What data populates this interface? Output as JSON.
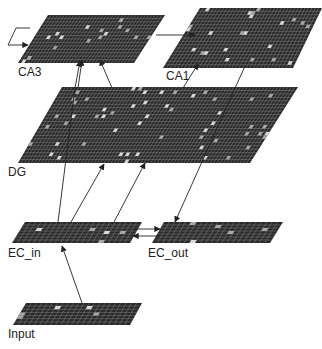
{
  "diagram": {
    "colors": {
      "background": "#ffffff",
      "layer_fill": "#2a2a2a",
      "grid_line": "#8a8a8a",
      "active_unit": "#d8d8d8",
      "arrow": "#222222",
      "label": "#222222"
    },
    "layers": [
      {
        "id": "ca3",
        "label": "CA3",
        "quad": [
          [
            48,
            15
          ],
          [
            165,
            15
          ],
          [
            134,
            63
          ],
          [
            18,
            63
          ]
        ],
        "cols": 36,
        "rows": 14,
        "label_pos": [
          18,
          66
        ]
      },
      {
        "id": "ca1",
        "label": "CA1",
        "quad": [
          [
            200,
            8
          ],
          [
            322,
            8
          ],
          [
            293,
            68
          ],
          [
            163,
            68
          ]
        ],
        "cols": 36,
        "rows": 18,
        "label_pos": [
          166,
          70
        ]
      },
      {
        "id": "dg",
        "label": "DG",
        "quad": [
          [
            62,
            87
          ],
          [
            298,
            87
          ],
          [
            250,
            163
          ],
          [
            18,
            163
          ]
        ],
        "cols": 70,
        "rows": 22,
        "label_pos": [
          8,
          166
        ]
      },
      {
        "id": "ec_in",
        "label": "EC_in",
        "quad": [
          [
            25,
            222
          ],
          [
            142,
            222
          ],
          [
            130,
            243
          ],
          [
            12,
            243
          ]
        ],
        "cols": 22,
        "rows": 7,
        "label_pos": [
          8,
          247
        ]
      },
      {
        "id": "ec_out",
        "label": "EC_out",
        "quad": [
          [
            164,
            222
          ],
          [
            283,
            222
          ],
          [
            270,
            243
          ],
          [
            152,
            243
          ]
        ],
        "cols": 22,
        "rows": 7,
        "label_pos": [
          148,
          247
        ]
      },
      {
        "id": "input",
        "label": "Input",
        "quad": [
          [
            26,
            303
          ],
          [
            142,
            303
          ],
          [
            130,
            325
          ],
          [
            13,
            325
          ]
        ],
        "cols": 22,
        "rows": 7,
        "label_pos": [
          8,
          328
        ]
      }
    ],
    "connections": [
      {
        "from": "ca3",
        "to": "ca3",
        "type": "recurrent",
        "path": [
          [
            30,
            28
          ],
          [
            16,
            28
          ],
          [
            8,
            45
          ],
          [
            28,
            45
          ]
        ],
        "arrow_at": [
          28,
          45
        ]
      },
      {
        "from": "ca3",
        "to": "ca1",
        "path": [
          [
            156,
            35
          ],
          [
            195,
            35
          ]
        ]
      },
      {
        "from": "dg",
        "to": "ca3",
        "path": [
          [
            78,
            88
          ],
          [
            82,
            60
          ]
        ]
      },
      {
        "from": "ec_in",
        "to": "ca3",
        "path": [
          [
            58,
            222
          ],
          [
            75,
            88
          ],
          [
            80,
            61
          ]
        ],
        "note": "long arrow passes through DG"
      },
      {
        "from": "dg",
        "to": "ca3",
        "path": [
          [
            112,
            88
          ],
          [
            100,
            60
          ]
        ]
      },
      {
        "from": "ec_in",
        "to": "ca1",
        "path": [
          [
            183,
            88
          ],
          [
            198,
            64
          ]
        ]
      },
      {
        "from": "ca1",
        "to": "ec_out",
        "path": [
          [
            245,
            66
          ],
          [
            175,
            222
          ]
        ]
      },
      {
        "from": "ec_in",
        "to": "dg",
        "path": [
          [
            71,
            222
          ],
          [
            104,
            164
          ]
        ]
      },
      {
        "from": "ec_in",
        "to": "ca1",
        "path": [
          [
            114,
            222
          ],
          [
            145,
            163
          ]
        ]
      },
      {
        "from": "ec_in",
        "to": "ec_out",
        "path": [
          [
            133,
            229
          ],
          [
            160,
            229
          ]
        ]
      },
      {
        "from": "ec_out",
        "to": "ec_in",
        "path": [
          [
            160,
            236
          ],
          [
            133,
            236
          ]
        ]
      },
      {
        "from": "input",
        "to": "ec_in",
        "path": [
          [
            82,
            303
          ],
          [
            62,
            246
          ]
        ]
      }
    ]
  }
}
